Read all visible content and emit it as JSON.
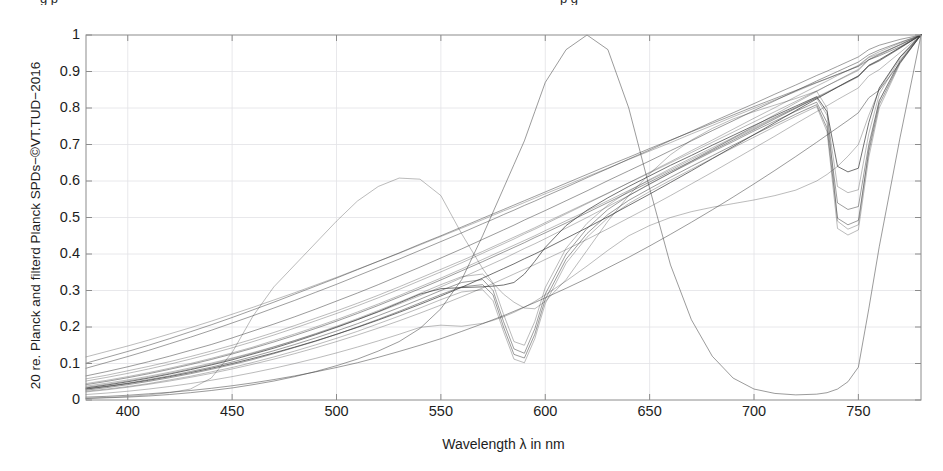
{
  "figure": {
    "clipped_title_left": "g  p",
    "clipped_title_right": "p              g",
    "ylabel": "20 re. Planck and filterd Planck SPDs−©VT.TUD−2016",
    "xlabel": "Wavelength λ in nm",
    "line_color": "#3a3a3a",
    "grid_color": "#e2e2e6",
    "axis_color": "#8c8c8c"
  },
  "chart_data": {
    "type": "line",
    "title": "",
    "xlabel": "Wavelength λ in nm",
    "ylabel": "20 re. Planck and filterd Planck SPDs−©VT.TUD−2016",
    "xlim": [
      380,
      780
    ],
    "ylim": [
      0,
      1
    ],
    "xticks": [
      400,
      450,
      500,
      550,
      600,
      650,
      700,
      750
    ],
    "yticks": [
      0,
      0.1,
      0.2,
      0.3,
      0.4,
      0.5,
      0.6,
      0.7,
      0.8,
      0.9,
      1
    ],
    "ytick_labels": [
      "0",
      "0.1",
      "0.2",
      "0.3",
      "0.4",
      "0.5",
      "0.6",
      "0.7",
      "0.8",
      "0.9",
      "1"
    ],
    "grid": true,
    "legend": "none",
    "x": [
      380,
      390,
      400,
      410,
      420,
      430,
      440,
      450,
      460,
      470,
      480,
      490,
      500,
      510,
      520,
      530,
      540,
      550,
      560,
      570,
      575,
      580,
      585,
      590,
      595,
      600,
      610,
      620,
      630,
      640,
      650,
      660,
      670,
      680,
      690,
      700,
      710,
      720,
      730,
      735,
      740,
      745,
      750,
      755,
      760,
      770,
      780
    ],
    "series": [
      {
        "name": "Planck 2700K",
        "values": [
          0.03,
          0.037,
          0.045,
          0.054,
          0.064,
          0.075,
          0.087,
          0.1,
          0.114,
          0.129,
          0.145,
          0.162,
          0.18,
          0.199,
          0.219,
          0.24,
          0.262,
          0.285,
          0.309,
          0.334,
          0.347,
          0.36,
          0.373,
          0.387,
          0.4,
          0.414,
          0.443,
          0.472,
          0.502,
          0.533,
          0.564,
          0.596,
          0.628,
          0.661,
          0.694,
          0.727,
          0.76,
          0.793,
          0.825,
          0.841,
          0.857,
          0.873,
          0.888,
          0.917,
          0.932,
          0.966,
          1.0
        ]
      },
      {
        "name": "Planck 3000K",
        "values": [
          0.038,
          0.046,
          0.055,
          0.065,
          0.076,
          0.088,
          0.101,
          0.115,
          0.13,
          0.146,
          0.163,
          0.181,
          0.2,
          0.22,
          0.241,
          0.263,
          0.286,
          0.31,
          0.335,
          0.361,
          0.374,
          0.387,
          0.401,
          0.415,
          0.428,
          0.442,
          0.471,
          0.5,
          0.53,
          0.56,
          0.591,
          0.622,
          0.654,
          0.686,
          0.718,
          0.75,
          0.782,
          0.814,
          0.845,
          0.861,
          0.876,
          0.891,
          0.906,
          0.933,
          0.947,
          0.974,
          1.0
        ]
      },
      {
        "name": "Planck 3500K",
        "values": [
          0.052,
          0.062,
          0.073,
          0.085,
          0.098,
          0.112,
          0.127,
          0.143,
          0.16,
          0.178,
          0.197,
          0.217,
          0.237,
          0.258,
          0.28,
          0.303,
          0.327,
          0.351,
          0.376,
          0.402,
          0.415,
          0.428,
          0.441,
          0.455,
          0.468,
          0.482,
          0.51,
          0.538,
          0.566,
          0.595,
          0.624,
          0.653,
          0.683,
          0.712,
          0.742,
          0.772,
          0.801,
          0.831,
          0.86,
          0.874,
          0.889,
          0.903,
          0.917,
          0.94,
          0.954,
          0.978,
          1.0
        ]
      },
      {
        "name": "Planck 4000K",
        "values": [
          0.066,
          0.078,
          0.091,
          0.105,
          0.12,
          0.136,
          0.152,
          0.17,
          0.189,
          0.208,
          0.228,
          0.249,
          0.271,
          0.293,
          0.316,
          0.34,
          0.364,
          0.389,
          0.414,
          0.44,
          0.453,
          0.466,
          0.479,
          0.493,
          0.506,
          0.519,
          0.546,
          0.573,
          0.601,
          0.628,
          0.655,
          0.683,
          0.71,
          0.738,
          0.765,
          0.793,
          0.82,
          0.847,
          0.874,
          0.887,
          0.9,
          0.913,
          0.926,
          0.946,
          0.959,
          0.98,
          1.0
        ]
      },
      {
        "name": "Planck 5000K",
        "values": [
          0.101,
          0.117,
          0.133,
          0.15,
          0.168,
          0.187,
          0.206,
          0.226,
          0.247,
          0.268,
          0.29,
          0.312,
          0.334,
          0.357,
          0.38,
          0.403,
          0.427,
          0.45,
          0.474,
          0.498,
          0.51,
          0.522,
          0.534,
          0.546,
          0.558,
          0.57,
          0.594,
          0.618,
          0.642,
          0.665,
          0.689,
          0.712,
          0.735,
          0.758,
          0.781,
          0.804,
          0.826,
          0.848,
          0.87,
          0.881,
          0.892,
          0.903,
          0.914,
          0.932,
          0.943,
          0.968,
          1.0
        ]
      },
      {
        "name": "Planck 2500K cool",
        "values": [
          0.022,
          0.028,
          0.035,
          0.043,
          0.052,
          0.062,
          0.073,
          0.085,
          0.098,
          0.112,
          0.127,
          0.143,
          0.16,
          0.178,
          0.197,
          0.217,
          0.238,
          0.26,
          0.283,
          0.307,
          0.319,
          0.332,
          0.345,
          0.358,
          0.371,
          0.385,
          0.412,
          0.44,
          0.469,
          0.499,
          0.529,
          0.56,
          0.592,
          0.624,
          0.657,
          0.69,
          0.723,
          0.757,
          0.79,
          0.806,
          0.823,
          0.839,
          0.855,
          0.888,
          0.905,
          0.952,
          1.0
        ]
      },
      {
        "name": "Planck low-slope",
        "values": [
          0.008,
          0.01,
          0.013,
          0.017,
          0.021,
          0.026,
          0.032,
          0.039,
          0.047,
          0.056,
          0.066,
          0.077,
          0.089,
          0.102,
          0.117,
          0.133,
          0.15,
          0.168,
          0.188,
          0.209,
          0.22,
          0.231,
          0.243,
          0.255,
          0.267,
          0.28,
          0.306,
          0.333,
          0.362,
          0.391,
          0.422,
          0.454,
          0.487,
          0.521,
          0.556,
          0.592,
          0.629,
          0.667,
          0.706,
          0.726,
          0.746,
          0.766,
          0.787,
          0.828,
          0.849,
          0.924,
          1.0
        ]
      },
      {
        "name": "Planck high-start",
        "values": [
          0.118,
          0.133,
          0.148,
          0.164,
          0.181,
          0.198,
          0.216,
          0.235,
          0.254,
          0.274,
          0.294,
          0.315,
          0.336,
          0.358,
          0.38,
          0.402,
          0.425,
          0.448,
          0.471,
          0.494,
          0.506,
          0.518,
          0.529,
          0.541,
          0.553,
          0.565,
          0.588,
          0.612,
          0.635,
          0.659,
          0.682,
          0.705,
          0.729,
          0.752,
          0.776,
          0.799,
          0.822,
          0.845,
          0.869,
          0.88,
          0.892,
          0.903,
          0.915,
          0.938,
          0.949,
          0.973,
          1.0
        ]
      },
      {
        "name": "Filtered notch 580 A",
        "values": [
          0.031,
          0.038,
          0.046,
          0.056,
          0.066,
          0.078,
          0.09,
          0.104,
          0.119,
          0.135,
          0.152,
          0.17,
          0.189,
          0.209,
          0.231,
          0.253,
          0.276,
          0.3,
          0.322,
          0.33,
          0.3,
          0.215,
          0.14,
          0.128,
          0.195,
          0.29,
          0.4,
          0.47,
          0.522,
          0.56,
          0.592,
          0.622,
          0.651,
          0.68,
          0.708,
          0.737,
          0.764,
          0.791,
          0.816,
          0.76,
          0.54,
          0.522,
          0.53,
          0.7,
          0.82,
          0.93,
          1.0
        ]
      },
      {
        "name": "Filtered notch 580 B",
        "values": [
          0.027,
          0.034,
          0.042,
          0.051,
          0.061,
          0.072,
          0.084,
          0.097,
          0.111,
          0.127,
          0.144,
          0.161,
          0.18,
          0.2,
          0.221,
          0.243,
          0.266,
          0.289,
          0.31,
          0.316,
          0.288,
          0.2,
          0.125,
          0.115,
          0.18,
          0.276,
          0.386,
          0.456,
          0.508,
          0.547,
          0.579,
          0.61,
          0.64,
          0.669,
          0.698,
          0.727,
          0.755,
          0.783,
          0.809,
          0.745,
          0.498,
          0.48,
          0.492,
          0.68,
          0.81,
          0.925,
          1.0
        ]
      },
      {
        "name": "Filtered notch 580 C",
        "values": [
          0.035,
          0.043,
          0.052,
          0.062,
          0.073,
          0.085,
          0.098,
          0.113,
          0.128,
          0.145,
          0.163,
          0.182,
          0.202,
          0.223,
          0.245,
          0.268,
          0.292,
          0.316,
          0.338,
          0.345,
          0.318,
          0.235,
          0.16,
          0.15,
          0.215,
          0.308,
          0.416,
          0.484,
          0.534,
          0.572,
          0.604,
          0.634,
          0.663,
          0.691,
          0.719,
          0.747,
          0.775,
          0.801,
          0.827,
          0.78,
          0.585,
          0.568,
          0.576,
          0.73,
          0.838,
          0.936,
          1.0
        ]
      },
      {
        "name": "Filtered notch 580 D",
        "values": [
          0.024,
          0.03,
          0.037,
          0.045,
          0.055,
          0.065,
          0.077,
          0.089,
          0.103,
          0.118,
          0.134,
          0.151,
          0.169,
          0.188,
          0.209,
          0.23,
          0.252,
          0.275,
          0.296,
          0.302,
          0.272,
          0.188,
          0.112,
          0.102,
          0.168,
          0.264,
          0.375,
          0.446,
          0.499,
          0.538,
          0.571,
          0.602,
          0.632,
          0.662,
          0.691,
          0.72,
          0.749,
          0.777,
          0.804,
          0.735,
          0.47,
          0.452,
          0.466,
          0.665,
          0.8,
          0.922,
          1.0
        ]
      },
      {
        "name": "Filtered shelf 555",
        "values": [
          0.033,
          0.041,
          0.05,
          0.06,
          0.071,
          0.083,
          0.096,
          0.11,
          0.126,
          0.142,
          0.16,
          0.179,
          0.199,
          0.22,
          0.242,
          0.266,
          0.29,
          0.305,
          0.308,
          0.31,
          0.312,
          0.315,
          0.322,
          0.345,
          0.38,
          0.418,
          0.478,
          0.52,
          0.554,
          0.585,
          0.614,
          0.643,
          0.67,
          0.698,
          0.725,
          0.752,
          0.779,
          0.805,
          0.831,
          0.79,
          0.64,
          0.625,
          0.635,
          0.76,
          0.855,
          0.94,
          1.0
        ]
      },
      {
        "name": "Filtered dip 530 low",
        "values": [
          0.015,
          0.019,
          0.024,
          0.03,
          0.037,
          0.045,
          0.054,
          0.064,
          0.075,
          0.087,
          0.1,
          0.114,
          0.129,
          0.145,
          0.162,
          0.18,
          0.199,
          0.205,
          0.202,
          0.21,
          0.218,
          0.228,
          0.24,
          0.254,
          0.27,
          0.288,
          0.326,
          0.367,
          0.41,
          0.45,
          0.478,
          0.5,
          0.516,
          0.528,
          0.538,
          0.548,
          0.56,
          0.575,
          0.6,
          0.618,
          0.64,
          0.668,
          0.7,
          0.78,
          0.85,
          0.94,
          1.0
        ]
      },
      {
        "name": "Filtered broad 470 rise",
        "values": [
          0.005,
          0.007,
          0.01,
          0.014,
          0.02,
          0.03,
          0.06,
          0.13,
          0.23,
          0.31,
          0.37,
          0.43,
          0.49,
          0.545,
          0.585,
          0.608,
          0.605,
          0.56,
          0.455,
          0.36,
          0.32,
          0.29,
          0.268,
          0.252,
          0.25,
          0.27,
          0.33,
          0.41,
          0.49,
          0.56,
          0.62,
          0.672,
          0.712,
          0.744,
          0.77,
          0.79,
          0.808,
          0.826,
          0.846,
          0.8,
          0.49,
          0.468,
          0.48,
          0.69,
          0.82,
          0.928,
          1.0
        ]
      },
      {
        "name": "Filtered bandpass 620",
        "values": [
          0.004,
          0.006,
          0.008,
          0.011,
          0.015,
          0.02,
          0.026,
          0.033,
          0.042,
          0.052,
          0.064,
          0.078,
          0.094,
          0.112,
          0.134,
          0.16,
          0.196,
          0.25,
          0.33,
          0.45,
          0.515,
          0.58,
          0.645,
          0.71,
          0.79,
          0.87,
          0.96,
          1.0,
          0.96,
          0.8,
          0.58,
          0.37,
          0.22,
          0.12,
          0.06,
          0.03,
          0.018,
          0.014,
          0.016,
          0.02,
          0.03,
          0.05,
          0.09,
          0.25,
          0.42,
          0.72,
          1.0
        ]
      },
      {
        "name": "Filtered steep linear",
        "values": [
          0.087,
          0.103,
          0.119,
          0.136,
          0.154,
          0.172,
          0.191,
          0.211,
          0.231,
          0.252,
          0.273,
          0.295,
          0.317,
          0.34,
          0.363,
          0.386,
          0.41,
          0.434,
          0.458,
          0.483,
          0.495,
          0.508,
          0.52,
          0.533,
          0.545,
          0.558,
          0.583,
          0.609,
          0.634,
          0.66,
          0.685,
          0.711,
          0.736,
          0.762,
          0.787,
          0.812,
          0.838,
          0.863,
          0.889,
          0.901,
          0.914,
          0.927,
          0.94,
          0.96,
          0.972,
          0.988,
          1.0
        ]
      },
      {
        "name": "Filtered mid cluster 1",
        "values": [
          0.045,
          0.054,
          0.064,
          0.075,
          0.087,
          0.1,
          0.114,
          0.129,
          0.145,
          0.163,
          0.181,
          0.2,
          0.22,
          0.241,
          0.263,
          0.286,
          0.31,
          0.334,
          0.359,
          0.385,
          0.398,
          0.411,
          0.424,
          0.437,
          0.45,
          0.464,
          0.491,
          0.518,
          0.546,
          0.574,
          0.602,
          0.63,
          0.659,
          0.687,
          0.716,
          0.744,
          0.773,
          0.801,
          0.83,
          0.844,
          0.858,
          0.873,
          0.887,
          0.916,
          0.93,
          0.965,
          1.0
        ]
      },
      {
        "name": "Filtered mid cluster 2",
        "values": [
          0.042,
          0.051,
          0.061,
          0.072,
          0.084,
          0.097,
          0.111,
          0.126,
          0.142,
          0.159,
          0.177,
          0.196,
          0.216,
          0.237,
          0.259,
          0.282,
          0.305,
          0.329,
          0.354,
          0.379,
          0.392,
          0.405,
          0.418,
          0.431,
          0.445,
          0.458,
          0.485,
          0.513,
          0.541,
          0.569,
          0.597,
          0.626,
          0.654,
          0.683,
          0.712,
          0.741,
          0.77,
          0.799,
          0.828,
          0.842,
          0.857,
          0.871,
          0.886,
          0.915,
          0.929,
          0.964,
          1.0
        ]
      },
      {
        "name": "Filtered mid cluster 3",
        "values": [
          0.058,
          0.068,
          0.08,
          0.092,
          0.105,
          0.119,
          0.134,
          0.15,
          0.167,
          0.185,
          0.204,
          0.224,
          0.244,
          0.265,
          0.287,
          0.31,
          0.334,
          0.358,
          0.382,
          0.407,
          0.42,
          0.433,
          0.446,
          0.459,
          0.472,
          0.486,
          0.513,
          0.54,
          0.567,
          0.595,
          0.622,
          0.65,
          0.678,
          0.706,
          0.734,
          0.762,
          0.79,
          0.818,
          0.847,
          0.861,
          0.875,
          0.889,
          0.903,
          0.932,
          0.946,
          0.973,
          1.0
        ]
      }
    ]
  }
}
